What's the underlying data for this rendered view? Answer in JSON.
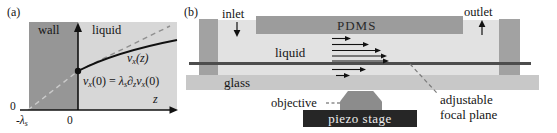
{
  "colors": {
    "wall_gray": "#969696",
    "liquid_a_gray": "#d7d7d7",
    "liquid_b_gray": "#e2e2e2",
    "pdms_gray": "#9c9c9c",
    "pillar_gray": "#a2a2a2",
    "glass_gray": "#c8c8c8",
    "focal_line_gray": "#4d4d4d",
    "piezo_dark": "#262626",
    "objective_gray": "#8c8c8c"
  },
  "panel_a": {
    "tag": "(a)",
    "wall_label": "wall",
    "liquid_label": "liquid",
    "curve_label": {
      "v": "v",
      "x": "x",
      "args": "(z)"
    },
    "slip_formula": {
      "v1": "v",
      "x1": "x",
      "arg1": "(0)",
      "eq": " = ",
      "lambda": "λ",
      "s": "s",
      "partial": "∂",
      "z": "z",
      "v2": "v",
      "x2": "x",
      "arg2": "(0)"
    },
    "origin_label": "0",
    "zero_label": "0",
    "neg_lambda": {
      "neg": "-",
      "lambda": "λ",
      "s": "s"
    },
    "z_axis_label": "z"
  },
  "panel_b": {
    "tag": "(b)",
    "inlet_label": "inlet",
    "outlet_label": "outlet",
    "pdms_label": "PDMS",
    "liquid_label": "liquid",
    "glass_label": "glass",
    "objective_label": "objective",
    "piezo_label": "piezo stage",
    "focal_label_line1": "adjustable",
    "focal_label_line2": "focal plane"
  }
}
